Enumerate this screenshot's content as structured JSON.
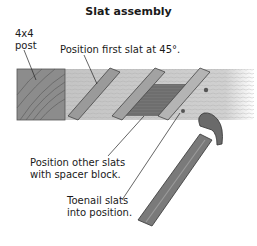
{
  "title": "Slat assembly",
  "labels": {
    "post_line1": "4x4",
    "post_line2": "post",
    "first_slat": "Position first slat at 45°.",
    "other_slats_line1": "Position other slats",
    "other_slats_line2": "with spacer block.",
    "toenail_line1": "Toenail slats",
    "toenail_line2": "into position."
  },
  "colors": {
    "background": "#ffffff",
    "text": "#1a1a1a",
    "post": "#8c8c8c",
    "rail": "#c8c8c8",
    "slat": "#9a9a9a",
    "spacer_block": "#6e6e6e",
    "hammer_handle": "#7a7a7a",
    "hammer_head": "#6a6a6a"
  }
}
